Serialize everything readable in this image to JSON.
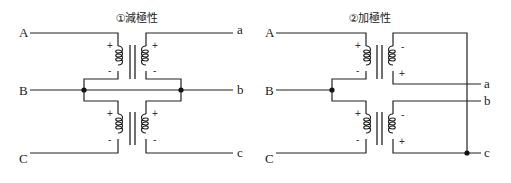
{
  "diagrams": [
    {
      "title": "①減極性",
      "terminals": {
        "A": "A",
        "B": "B",
        "C": "C",
        "a": "a",
        "b": "b",
        "c": "c"
      },
      "upper": {
        "prim_top": "+",
        "prim_bot": "-",
        "sec_top": "+",
        "sec_bot": "-"
      },
      "lower": {
        "prim_top": "+",
        "prim_bot": "-",
        "sec_top": "+",
        "sec_bot": "-"
      }
    },
    {
      "title": "②加極性",
      "terminals": {
        "A": "A",
        "B": "B",
        "C": "C",
        "a": "a",
        "b": "b",
        "c": "c"
      },
      "upper": {
        "prim_top": "+",
        "prim_bot": "-",
        "sec_top": "-",
        "sec_bot": "+"
      },
      "lower": {
        "prim_top": "+",
        "prim_bot": "-",
        "sec_top": "-",
        "sec_bot": "+"
      }
    }
  ],
  "colors": {
    "line": "#222222",
    "background": "#ffffff"
  }
}
